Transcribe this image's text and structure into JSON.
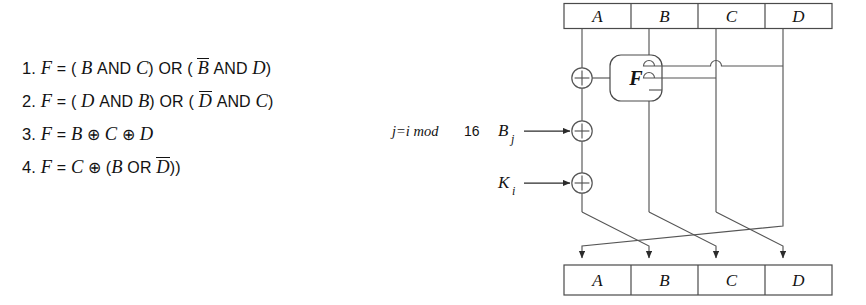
{
  "formulas": [
    {
      "number": "1.",
      "text": "F = ( B AND C) OR ( B̄ AND D)",
      "lhs": "F",
      "eq": "=",
      "parts": [
        "(",
        "B",
        "AND",
        "C",
        ")",
        "OR",
        "(",
        "B",
        "AND",
        "D",
        ")"
      ]
    },
    {
      "number": "2.",
      "text": "F = ( D AND B) OR ( D̄ AND C)",
      "lhs": "F",
      "eq": "=",
      "parts": [
        "(",
        "D",
        "AND",
        "B",
        ")",
        "OR",
        "(",
        "D",
        "AND",
        "C",
        ")"
      ]
    },
    {
      "number": "3.",
      "text": "F = B ⊕ C ⊕ D",
      "lhs": "F",
      "eq": "=",
      "parts": [
        "B",
        "⊕",
        "C",
        "⊕",
        "D"
      ]
    },
    {
      "number": "4.",
      "text": "F = C ⊕ (B OR D̄))",
      "lhs": "F",
      "eq": "=",
      "parts": [
        "C",
        "⊕",
        "(",
        "B",
        "OR",
        "D",
        "))"
      ]
    }
  ],
  "formula_tokens": {
    "f": "F",
    "equals": "=",
    "lparen": "(",
    "rparen": ")",
    "and": "AND",
    "or": "OR",
    "xor": "⊕",
    "A": "A",
    "B": "B",
    "C": "C",
    "D": "D",
    "num1": "1.",
    "num2": "2.",
    "num3": "3.",
    "num4": "4.",
    "rparen2": "))"
  },
  "diagram": {
    "top_register": {
      "name": "top-register",
      "cells": [
        "A",
        "B",
        "C",
        "D"
      ]
    },
    "bottom_register": {
      "name": "bottom-register",
      "cells": [
        "A",
        "B",
        "C",
        "D"
      ]
    },
    "function_box": {
      "label": "F"
    },
    "inputs": [
      {
        "label": "B",
        "subscript": "j",
        "name": "input-bj"
      },
      {
        "label": "K",
        "subscript": "i",
        "name": "input-ki"
      }
    ],
    "annotation": {
      "prefix": "j=i mod",
      "value": "16",
      "full": "j=i mod 16"
    },
    "xor_symbol": "+",
    "colors": {
      "line": "#555555",
      "box_border": "#4a4a4a",
      "text": "#131313",
      "background": "#ffffff"
    }
  }
}
